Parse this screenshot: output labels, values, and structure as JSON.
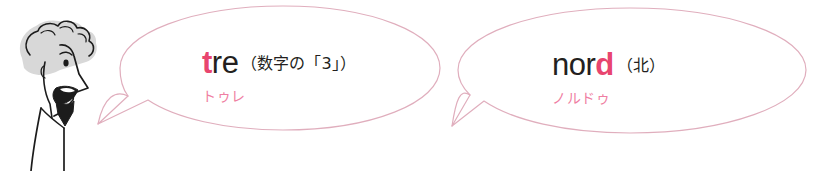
{
  "scene": {
    "width": 821,
    "height": 171,
    "background": "#ffffff",
    "description": "illustration-of-man-speaking-with-two-speech-bubbles"
  },
  "colors": {
    "accent_pink": "#e8456f",
    "reading_pink": "#ef7fa3",
    "bubble_outline": "#e3b3c2",
    "ink": "#231f20",
    "hair_gray": "#d9d9d9"
  },
  "speaker": {
    "name": "man-illustration",
    "alt": "line drawing of a man with curly hair and beard speaking"
  },
  "bubbles": [
    {
      "id": "bubble-one",
      "word_prefix": "t",
      "word_rest": "re",
      "word_full": "tre",
      "gloss": "（数字の「3」）",
      "reading": "トゥレ"
    },
    {
      "id": "bubble-two",
      "word_prefix": "nor",
      "word_rest": "d",
      "word_full": "nord",
      "gloss": "（北）",
      "reading": "ノルドゥ"
    }
  ]
}
